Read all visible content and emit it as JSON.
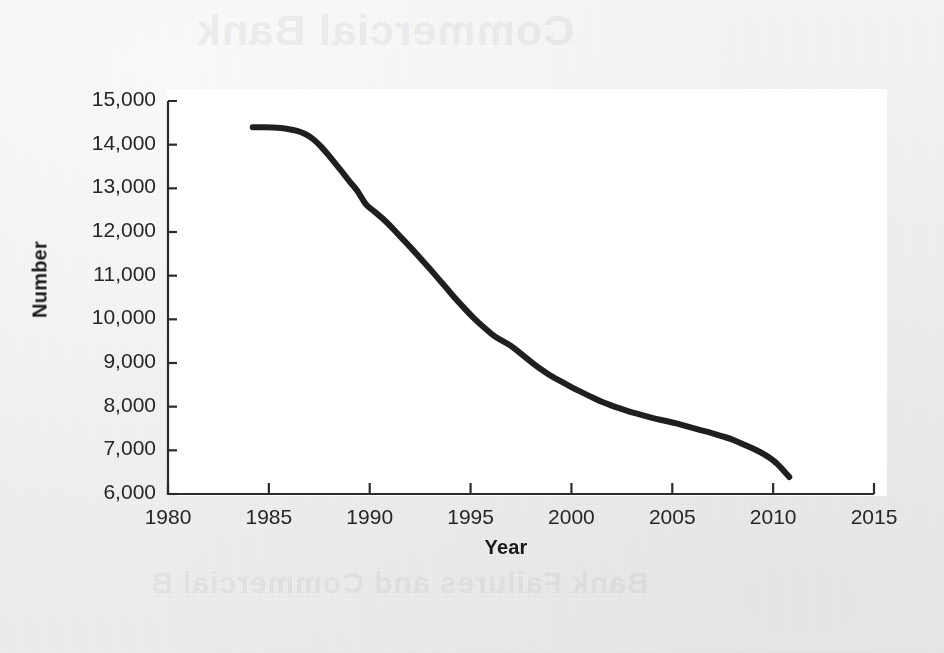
{
  "page": {
    "background_color": "#f1f1f1",
    "bleed_through_top_text": "Commercial Bank",
    "bleed_through_bottom_text": "Bank Failures and Commercial B"
  },
  "chart_data": {
    "type": "line",
    "title": "",
    "xlabel": "Year",
    "ylabel": "Number",
    "xlim": [
      1980,
      2015
    ],
    "ylim": [
      6000,
      15000
    ],
    "grid": false,
    "legend": "none",
    "line_color": "#1f1f1f",
    "line_width_px": 6,
    "xticks": [
      1980,
      1985,
      1990,
      1995,
      2000,
      2005,
      2010,
      2015
    ],
    "xtick_labels": [
      "1980",
      "1985",
      "1990",
      "1995",
      "2000",
      "2005",
      "2010",
      "2015"
    ],
    "yticks": [
      6000,
      7000,
      8000,
      9000,
      10000,
      11000,
      12000,
      13000,
      14000,
      15000
    ],
    "ytick_labels": [
      "6,000",
      "7,000",
      "8,000",
      "9,000",
      "10,000",
      "11,000",
      "12,000",
      "13,000",
      "14,000",
      "15,000"
    ],
    "series": [
      {
        "name": "Number of commercial banks",
        "x": [
          1984.2,
          1984.6,
          1985.0,
          1985.4,
          1985.8,
          1986.2,
          1986.6,
          1987.0,
          1987.4,
          1987.8,
          1988.2,
          1988.6,
          1989.0,
          1989.4,
          1989.8,
          1990.2,
          1990.6,
          1991.0,
          1991.4,
          1991.8,
          1992.2,
          1992.6,
          1993.0,
          1993.4,
          1993.8,
          1994.2,
          1994.6,
          1995.0,
          1995.4,
          1995.8,
          1996.2,
          1996.6,
          1997.0,
          1997.4,
          1997.8,
          1998.2,
          1998.6,
          1999.0,
          1999.4,
          1999.8,
          2000.2,
          2000.6,
          2001.0,
          2001.4,
          2001.8,
          2002.2,
          2002.6,
          2003.0,
          2003.4,
          2003.8,
          2004.2,
          2004.6,
          2005.0,
          2005.4,
          2005.8,
          2006.2,
          2006.6,
          2007.0,
          2007.4,
          2007.8,
          2008.2,
          2008.6,
          2009.0,
          2009.4,
          2009.8,
          2010.2,
          2010.8
        ],
        "y": [
          14400,
          14400,
          14395,
          14390,
          14370,
          14340,
          14290,
          14200,
          14050,
          13850,
          13620,
          13400,
          13150,
          12950,
          12620,
          12480,
          12330,
          12150,
          11950,
          11760,
          11560,
          11350,
          11150,
          10930,
          10720,
          10500,
          10300,
          10100,
          9920,
          9760,
          9600,
          9500,
          9400,
          9250,
          9100,
          8950,
          8820,
          8700,
          8600,
          8500,
          8400,
          8310,
          8220,
          8130,
          8060,
          7990,
          7930,
          7870,
          7820,
          7770,
          7720,
          7680,
          7640,
          7590,
          7540,
          7490,
          7440,
          7390,
          7330,
          7280,
          7200,
          7120,
          7040,
          6950,
          6840,
          6700,
          6390
        ]
      }
    ]
  }
}
